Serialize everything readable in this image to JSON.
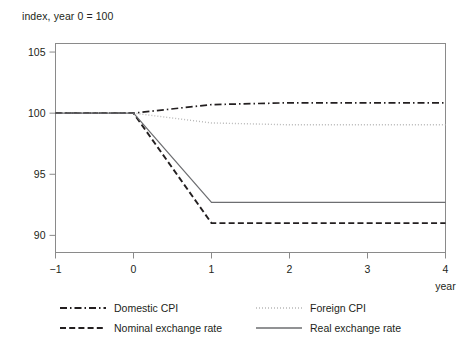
{
  "chart_data": {
    "type": "line",
    "title": "",
    "subtitle": "",
    "ylabel": "index, year 0 = 100",
    "xlabel": "year",
    "x": [
      -1,
      0,
      1,
      2,
      3,
      4
    ],
    "xlim": [
      -1,
      4
    ],
    "ylim": [
      88.6,
      105.7
    ],
    "xticks": [
      -1,
      0,
      1,
      2,
      3,
      4
    ],
    "xtick_labels": [
      "−1",
      "0",
      "1",
      "2",
      "3",
      "4"
    ],
    "yticks": [
      90,
      95,
      100,
      105
    ],
    "ytick_labels": [
      "90",
      "95",
      "100",
      "105"
    ],
    "grid": false,
    "legend_position": "bottom",
    "series": [
      {
        "name": "Domestic CPI",
        "style": "dash-dot",
        "color": "#231f20",
        "width": 1.7,
        "values": [
          100,
          100,
          100.7,
          100.85,
          100.85,
          100.85
        ]
      },
      {
        "name": "Foreign CPI",
        "style": "dotted",
        "color": "#b8b8b8",
        "width": 1.4,
        "values": [
          100,
          100,
          99.2,
          99.05,
          99.05,
          99.05
        ]
      },
      {
        "name": "Nominal exchange rate",
        "style": "dashed",
        "color": "#231f20",
        "width": 1.9,
        "values": [
          100,
          100,
          91.0,
          91.0,
          91.0,
          91.0
        ]
      },
      {
        "name": "Real exchange rate",
        "style": "solid",
        "color": "#6d6e71",
        "width": 1.2,
        "values": [
          100,
          100,
          92.7,
          92.7,
          92.7,
          92.7
        ]
      }
    ]
  },
  "legend": {
    "entries": [
      {
        "label": "Domestic CPI"
      },
      {
        "label": "Foreign CPI"
      },
      {
        "label": "Nominal exchange rate"
      },
      {
        "label": "Real exchange rate"
      }
    ]
  },
  "colors": {
    "frame": "#8a8a8a",
    "text": "#231f20",
    "domestic_cpi": "#231f20",
    "foreign_cpi": "#b8b8b8",
    "nominal_rate": "#231f20",
    "real_rate": "#6d6e71"
  }
}
